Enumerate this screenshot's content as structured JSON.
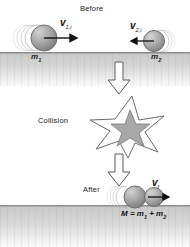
{
  "figure": {
    "background": "#ffffff",
    "ground_color": "#c9c9c9",
    "ball_color": "#9a9a9a",
    "star_fill": "#a8a8a8",
    "arrow_fill": "#fdfdfd",
    "outline_color": "#4a4a4a"
  },
  "before": {
    "caption": "Before",
    "ball1": {
      "mass_label": "m",
      "mass_sub": "1",
      "velocity_label": "v",
      "velocity_sub": "1,i",
      "direction": "right"
    },
    "ball2": {
      "mass_label": "m",
      "mass_sub": "2",
      "velocity_label": "v",
      "velocity_sub": "2,i",
      "direction": "left"
    }
  },
  "collision": {
    "caption": "Collision",
    "arrow_down_top": "down-arrow-icon",
    "star": "collision-star-icon"
  },
  "after": {
    "caption": "After",
    "velocity_label": "v",
    "velocity_sub": "f",
    "equation": "M = m",
    "equation_sub1": "1",
    "equation_mid": " + m",
    "equation_sub2": "2",
    "direction": "right"
  }
}
